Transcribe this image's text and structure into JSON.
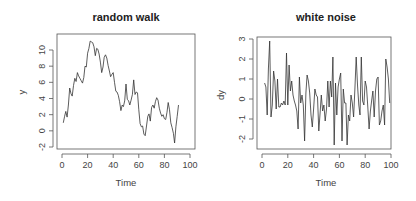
{
  "chart_data": [
    {
      "type": "line",
      "title": "random walk",
      "xlabel": "Time",
      "ylabel": "y",
      "xlim": [
        0,
        100
      ],
      "ylim": [
        -2,
        11.2
      ],
      "xticks": [
        0,
        20,
        40,
        60,
        80,
        100
      ],
      "yticks": [
        -2,
        0,
        2,
        4,
        6,
        8,
        10
      ],
      "grid": false,
      "frame": {
        "left": 57,
        "right": 195,
        "top": 34,
        "bottom": 149
      },
      "xmap": {
        "x0": 62,
        "x100": 190
      },
      "ymap": {
        "v": 10,
        "py": 50,
        "v2": -2,
        "py2": 147
      },
      "x": [
        1,
        2,
        3,
        4,
        5,
        6,
        7,
        8,
        9,
        10,
        11,
        12,
        13,
        14,
        15,
        16,
        17,
        18,
        19,
        20,
        21,
        22,
        23,
        24,
        25,
        26,
        27,
        28,
        29,
        30,
        31,
        32,
        33,
        34,
        35,
        36,
        37,
        38,
        39,
        40,
        41,
        42,
        43,
        44,
        45,
        46,
        47,
        48,
        49,
        50,
        51,
        52,
        53,
        54,
        55,
        56,
        57,
        58,
        59,
        60,
        61,
        62,
        63,
        64,
        65,
        66,
        67,
        68,
        69,
        70,
        71,
        72,
        73,
        74,
        75,
        76,
        77,
        78,
        79,
        80,
        81,
        82,
        83,
        84,
        85,
        86,
        87,
        88,
        89,
        90,
        91,
        92,
        93,
        94,
        95,
        96,
        97,
        98,
        99,
        100
      ],
      "values": [
        1.0,
        1.8,
        2.4,
        1.7,
        3.2,
        5.3,
        4.6,
        4.3,
        5.6,
        6.5,
        6.1,
        7.2,
        6.8,
        6.5,
        6.2,
        5.9,
        6.6,
        8.0,
        7.9,
        9.6,
        10.2,
        11.1,
        11.0,
        10.9,
        10.4,
        9.3,
        10.2,
        10.1,
        9.5,
        8.5,
        7.2,
        7.9,
        9.1,
        9.4,
        9.0,
        8.1,
        7.4,
        6.7,
        7.0,
        7.2,
        6.0,
        4.9,
        4.8,
        4.4,
        3.6,
        2.5,
        3.2,
        3.0,
        3.7,
        5.8,
        3.9,
        3.7,
        3.2,
        3.8,
        4.5,
        6.3,
        4.5,
        4.8,
        4.7,
        2.6,
        0.9,
        0.5,
        0.6,
        -0.4,
        -0.6,
        0.6,
        1.8,
        2.1,
        1.2,
        2.9,
        3.2,
        2.8,
        3.6,
        4.1,
        3.8,
        2.8,
        2.2,
        1.8,
        2.0,
        1.5,
        1.4,
        2.3,
        3.5,
        2.6,
        1.0,
        0.4,
        -0.3,
        -1.5,
        0.5,
        1.8,
        3.2
      ],
      "series_name": "random walk"
    },
    {
      "type": "line",
      "title": "white noise",
      "xlabel": "Time",
      "ylabel": "dy",
      "xlim": [
        0,
        100
      ],
      "ylim": [
        -2.5,
        3.1
      ],
      "xticks": [
        0,
        20,
        40,
        60,
        80,
        100
      ],
      "yticks": [
        -2,
        -1,
        0,
        1,
        2,
        3
      ],
      "grid": false,
      "frame": {
        "left": 257,
        "right": 391,
        "top": 37,
        "bottom": 149
      },
      "xmap": {
        "x0": 262,
        "x100": 391
      },
      "ymap": {
        "v": 3,
        "py": 39,
        "v2": -2,
        "py2": 139
      },
      "x": [
        2,
        3,
        4,
        5,
        6,
        7,
        8,
        9,
        10,
        11,
        12,
        13,
        14,
        15,
        16,
        17,
        18,
        19,
        20,
        21,
        22,
        23,
        24,
        25,
        26,
        27,
        28,
        29,
        30,
        31,
        32,
        33,
        34,
        35,
        36,
        37,
        38,
        39,
        40,
        41,
        42,
        43,
        44,
        45,
        46,
        47,
        48,
        49,
        50,
        51,
        52,
        53,
        54,
        55,
        56,
        57,
        58,
        59,
        60,
        61,
        62,
        63,
        64,
        65,
        66,
        67,
        68,
        69,
        70,
        71,
        72,
        73,
        74,
        75,
        76,
        77,
        78,
        79,
        80,
        81,
        82,
        83,
        84,
        85,
        86,
        87,
        88,
        89,
        90,
        91,
        92,
        93,
        94,
        95,
        96,
        97,
        98,
        99
      ],
      "values": [
        0.8,
        0.6,
        -0.8,
        1.5,
        2.9,
        -0.9,
        -0.3,
        1.4,
        0.9,
        -0.5,
        1.0,
        -0.4,
        -0.4,
        -0.2,
        -0.3,
        -0.1,
        -0.3,
        2.3,
        -0.3,
        1.7,
        0.4,
        0.9,
        0.2,
        -0.1,
        -0.3,
        -0.6,
        -1.5,
        1.1,
        -0.2,
        0.2,
        -0.3,
        -2.1,
        0.3,
        1.2,
        0.9,
        0.3,
        -0.8,
        -1.4,
        -0.5,
        0.5,
        0.2,
        0.1,
        -1.6,
        -0.7,
        0.2,
        -0.6,
        -0.3,
        -1.1,
        -0.5,
        0.9,
        -0.4,
        0.9,
        0.1,
        2.1,
        -2.3,
        0.8,
        -0.8,
        0.6,
        1.0,
        1.3,
        -2.1,
        0.5,
        -0.2,
        -0.2,
        -2.3,
        -0.8,
        -1.1,
        0.2,
        -0.2,
        -0.9,
        0.5,
        2.1,
        0.7,
        -0.3,
        -0.8,
        2.1,
        -0.1,
        -0.3,
        0.9,
        0.6,
        -0.4,
        -1.5,
        -0.6,
        -0.1,
        0.4,
        -0.9,
        0.4,
        1.0,
        1.1,
        -1.3,
        -1.1,
        -0.6,
        -0.3,
        -1.3,
        2.0,
        1.6,
        1.0,
        -0.2
      ],
      "series_name": "white noise"
    }
  ]
}
